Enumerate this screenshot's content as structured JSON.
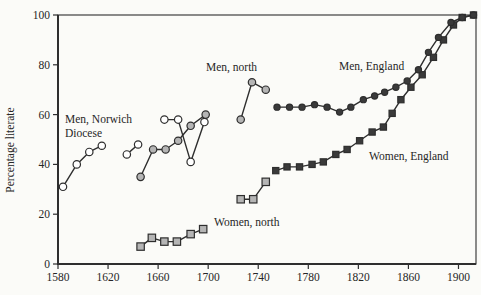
{
  "chart_data": {
    "type": "line",
    "title": "",
    "xlabel": "",
    "ylabel": "Percentage literate",
    "xlim": [
      1580,
      1914
    ],
    "ylim": [
      0,
      100
    ],
    "x_ticks": [
      1580,
      1620,
      1660,
      1700,
      1740,
      1780,
      1820,
      1860,
      1900
    ],
    "y_ticks": [
      0,
      20,
      40,
      60,
      80,
      100
    ],
    "grid": false,
    "frame": true,
    "legend_position": "inline-annotations",
    "colors": {
      "line": "#2e2e2e",
      "open_fill": "#ffffff",
      "gray_fill": "#b5b5b5",
      "dark_fill": "#3a3a3a",
      "text": "#262626",
      "background": "#fbfbf8"
    },
    "series": [
      {
        "name": "Men, Norwich Diocese",
        "marker": "circle",
        "fill": "#ffffff",
        "size": 3.7,
        "segments": [
          [
            [
              1584,
              31
            ],
            [
              1595,
              40
            ],
            [
              1605,
              45
            ],
            [
              1615,
              47.5
            ]
          ],
          [
            [
              1635,
              44
            ],
            [
              1644,
              48
            ]
          ],
          [
            [
              1665,
              58
            ],
            [
              1676,
              58
            ],
            [
              1686,
              41
            ],
            [
              1697,
              57
            ]
          ]
        ]
      },
      {
        "name": "Men, north",
        "marker": "circle",
        "fill": "#b5b5b5",
        "size": 3.7,
        "segments": [
          [
            [
              1646,
              35
            ],
            [
              1656,
              46
            ],
            [
              1666,
              46
            ],
            [
              1676,
              49.5
            ],
            [
              1686,
              55.5
            ],
            [
              1698,
              60
            ]
          ],
          [
            [
              1726,
              58
            ],
            [
              1735,
              73
            ],
            [
              1746,
              70
            ]
          ]
        ]
      },
      {
        "name": "Women, north",
        "marker": "square",
        "fill": "#b5b5b5",
        "size": 3.7,
        "segments": [
          [
            [
              1646,
              7
            ],
            [
              1655,
              10.5
            ],
            [
              1665,
              9
            ],
            [
              1675,
              9
            ],
            [
              1686,
              12
            ],
            [
              1696,
              14
            ]
          ],
          [
            [
              1726,
              26
            ],
            [
              1736,
              26
            ],
            [
              1746,
              33
            ]
          ]
        ]
      },
      {
        "name": "Women, England",
        "marker": "square",
        "fill": "#3a3a3a",
        "size": 3.1,
        "segments": [
          [
            [
              1754,
              37.5
            ],
            [
              1763,
              39
            ],
            [
              1773,
              39
            ],
            [
              1783,
              40
            ],
            [
              1792,
              41
            ],
            [
              1802,
              44
            ],
            [
              1811,
              46
            ],
            [
              1821,
              49.5
            ],
            [
              1831,
              53
            ],
            [
              1840,
              55
            ],
            [
              1847,
              60.5
            ],
            [
              1854,
              66
            ],
            [
              1862,
              71
            ],
            [
              1871,
              76
            ],
            [
              1880,
              83
            ],
            [
              1888,
              90
            ],
            [
              1896,
              96
            ],
            [
              1903,
              99
            ],
            [
              1912,
              100
            ]
          ]
        ]
      },
      {
        "name": "Men, England",
        "marker": "circle",
        "fill": "#3a3a3a",
        "size": 3.1,
        "segments": [
          [
            [
              1755,
              63
            ],
            [
              1765,
              63
            ],
            [
              1775,
              63
            ],
            [
              1785,
              64
            ],
            [
              1795,
              63
            ],
            [
              1805,
              61
            ],
            [
              1814,
              63
            ],
            [
              1824,
              66
            ],
            [
              1833,
              67.5
            ],
            [
              1841,
              69
            ],
            [
              1850,
              71
            ],
            [
              1859,
              73.5
            ],
            [
              1868,
              78
            ],
            [
              1876,
              85
            ],
            [
              1884,
              91
            ],
            [
              1894,
              97
            ],
            [
              1903,
              99
            ],
            [
              1912,
              100
            ]
          ]
        ]
      }
    ],
    "annotations": [
      {
        "id": "label-men-norwich-line1",
        "text": "Men, Norwich",
        "x": 65,
        "y": 123
      },
      {
        "id": "label-men-norwich-line2",
        "text": "Diocese",
        "x": 65,
        "y": 137
      },
      {
        "id": "label-men-north",
        "text": "Men, north",
        "x": 206,
        "y": 71
      },
      {
        "id": "label-men-england",
        "text": "Men, England",
        "x": 339,
        "y": 70
      },
      {
        "id": "label-women-england",
        "text": "Women, England",
        "x": 369,
        "y": 160
      },
      {
        "id": "label-women-north",
        "text": "Women, north",
        "x": 214,
        "y": 226
      }
    ]
  }
}
